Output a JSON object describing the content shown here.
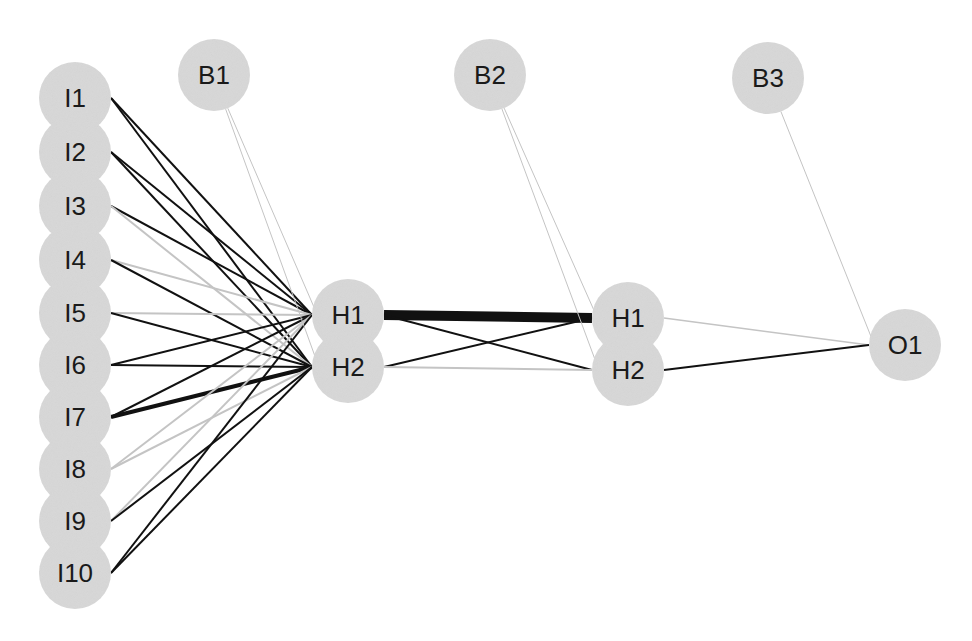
{
  "diagram": {
    "type": "neural-network",
    "style": {
      "node_fill": "#d8d8d8",
      "label_color": "#1a1a1a",
      "positive_edge_color": "#111111",
      "negative_edge_color": "#c4c4c4",
      "background": "#ffffff"
    },
    "nodes": [
      {
        "id": "I1",
        "label": "I1",
        "layer": "input",
        "x": 75,
        "y": 98
      },
      {
        "id": "I2",
        "label": "I2",
        "layer": "input",
        "x": 75,
        "y": 152
      },
      {
        "id": "I3",
        "label": "I3",
        "layer": "input",
        "x": 75,
        "y": 206
      },
      {
        "id": "I4",
        "label": "I4",
        "layer": "input",
        "x": 75,
        "y": 260
      },
      {
        "id": "I5",
        "label": "I5",
        "layer": "input",
        "x": 75,
        "y": 313
      },
      {
        "id": "I6",
        "label": "I6",
        "layer": "input",
        "x": 75,
        "y": 365
      },
      {
        "id": "I7",
        "label": "I7",
        "layer": "input",
        "x": 75,
        "y": 417
      },
      {
        "id": "I8",
        "label": "I8",
        "layer": "input",
        "x": 75,
        "y": 469
      },
      {
        "id": "I9",
        "label": "I9",
        "layer": "input",
        "x": 75,
        "y": 521
      },
      {
        "id": "I10",
        "label": "I10",
        "layer": "input",
        "x": 75,
        "y": 573
      },
      {
        "id": "B1",
        "label": "B1",
        "layer": "bias",
        "x": 214,
        "y": 75
      },
      {
        "id": "B2",
        "label": "B2",
        "layer": "bias",
        "x": 490,
        "y": 75
      },
      {
        "id": "B3",
        "label": "B3",
        "layer": "bias",
        "x": 768,
        "y": 78
      },
      {
        "id": "H1a",
        "label": "H1",
        "layer": "hidden1",
        "x": 348,
        "y": 315
      },
      {
        "id": "H2a",
        "label": "H2",
        "layer": "hidden1",
        "x": 348,
        "y": 367
      },
      {
        "id": "H1b",
        "label": "H1",
        "layer": "hidden2",
        "x": 628,
        "y": 318
      },
      {
        "id": "H2b",
        "label": "H2",
        "layer": "hidden2",
        "x": 628,
        "y": 370
      },
      {
        "id": "O1",
        "label": "O1",
        "layer": "output",
        "x": 905,
        "y": 345
      }
    ],
    "edges": [
      {
        "from": "I1",
        "to": "H1a",
        "sign": "positive",
        "width": 2
      },
      {
        "from": "I1",
        "to": "H2a",
        "sign": "positive",
        "width": 2
      },
      {
        "from": "I2",
        "to": "H1a",
        "sign": "positive",
        "width": 2
      },
      {
        "from": "I2",
        "to": "H2a",
        "sign": "positive",
        "width": 2
      },
      {
        "from": "I3",
        "to": "H1a",
        "sign": "positive",
        "width": 2
      },
      {
        "from": "I3",
        "to": "H2a",
        "sign": "negative",
        "width": 2
      },
      {
        "from": "I4",
        "to": "H1a",
        "sign": "negative",
        "width": 2
      },
      {
        "from": "I4",
        "to": "H2a",
        "sign": "positive",
        "width": 2
      },
      {
        "from": "I5",
        "to": "H1a",
        "sign": "negative",
        "width": 2
      },
      {
        "from": "I5",
        "to": "H2a",
        "sign": "positive",
        "width": 2
      },
      {
        "from": "I6",
        "to": "H1a",
        "sign": "positive",
        "width": 2
      },
      {
        "from": "I6",
        "to": "H2a",
        "sign": "positive",
        "width": 2
      },
      {
        "from": "I7",
        "to": "H1a",
        "sign": "positive",
        "width": 2
      },
      {
        "from": "I7",
        "to": "H2a",
        "sign": "positive",
        "width": 4
      },
      {
        "from": "I8",
        "to": "H1a",
        "sign": "negative",
        "width": 2
      },
      {
        "from": "I8",
        "to": "H2a",
        "sign": "negative",
        "width": 2
      },
      {
        "from": "I9",
        "to": "H1a",
        "sign": "negative",
        "width": 2
      },
      {
        "from": "I9",
        "to": "H2a",
        "sign": "positive",
        "width": 2
      },
      {
        "from": "I10",
        "to": "H1a",
        "sign": "positive",
        "width": 2
      },
      {
        "from": "I10",
        "to": "H2a",
        "sign": "positive",
        "width": 2
      },
      {
        "from": "B1",
        "to": "H1a",
        "sign": "negative",
        "width": 1
      },
      {
        "from": "B1",
        "to": "H2a",
        "sign": "negative",
        "width": 1
      },
      {
        "from": "H1a",
        "to": "H1b",
        "sign": "positive",
        "width": 10
      },
      {
        "from": "H1a",
        "to": "H2b",
        "sign": "positive",
        "width": 2
      },
      {
        "from": "H2a",
        "to": "H1b",
        "sign": "positive",
        "width": 2
      },
      {
        "from": "H2a",
        "to": "H2b",
        "sign": "negative",
        "width": 2
      },
      {
        "from": "B2",
        "to": "H1b",
        "sign": "negative",
        "width": 1
      },
      {
        "from": "B2",
        "to": "H2b",
        "sign": "negative",
        "width": 1
      },
      {
        "from": "H1b",
        "to": "O1",
        "sign": "negative",
        "width": 1.5
      },
      {
        "from": "H2b",
        "to": "O1",
        "sign": "positive",
        "width": 2
      },
      {
        "from": "B3",
        "to": "O1",
        "sign": "negative",
        "width": 1
      }
    ],
    "node_radius": 36
  }
}
